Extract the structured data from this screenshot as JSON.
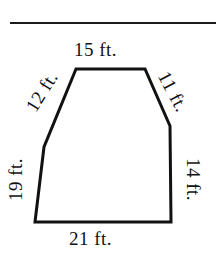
{
  "document": {
    "type": "geometry-figure",
    "divider": {
      "name": "horizontal-rule",
      "color": "#1a1a1a"
    }
  },
  "figure": {
    "shape_name": "hexagon",
    "stroke_color": "#111111",
    "fill_color": "#ffffff",
    "stroke_width": 3,
    "unit": "ft.",
    "vertices": [
      {
        "name": "top-left",
        "x": 76,
        "y": 69
      },
      {
        "name": "top-right",
        "x": 145,
        "y": 69
      },
      {
        "name": "right-upper-bend",
        "x": 170,
        "y": 126
      },
      {
        "name": "bottom-right",
        "x": 171,
        "y": 222
      },
      {
        "name": "bottom-left",
        "x": 35,
        "y": 222
      },
      {
        "name": "left-lower-bend",
        "x": 44,
        "y": 147
      }
    ],
    "sides": {
      "top": "15 ft.",
      "upper_right": "11 ft.",
      "right": "14 ft.",
      "bottom": "21 ft.",
      "lower_left": "19 ft.",
      "upper_left": "12 ft."
    }
  }
}
